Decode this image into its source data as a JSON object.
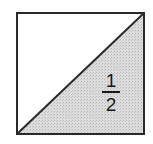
{
  "diagram": {
    "shape": "square",
    "divided_by": "diagonal",
    "shaded_region": "lower-right triangle",
    "colors": {
      "fill": "#d4d4d4",
      "stroke": "#2a2a2a",
      "background": "#ffffff"
    },
    "label": {
      "numerator": "1",
      "denominator": "2"
    }
  }
}
